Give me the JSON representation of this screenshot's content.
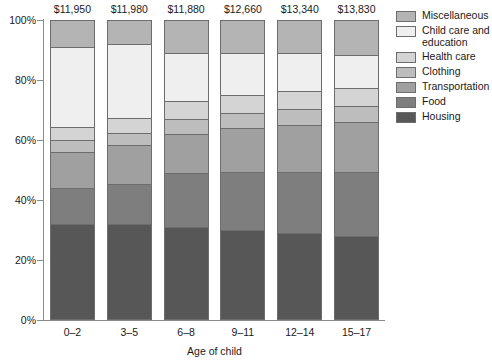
{
  "chart_data": {
    "type": "bar",
    "subtype": "stacked-percentage-column",
    "title": "",
    "xlabel": "Age of child",
    "ylabel": "",
    "ylim": [
      0,
      100
    ],
    "ytick_labels": [
      "0%",
      "20%",
      "40%",
      "60%",
      "80%",
      "100%"
    ],
    "ytick_values": [
      0,
      20,
      40,
      60,
      80,
      100
    ],
    "grid": false,
    "legend_position": "right",
    "categories": [
      "0–2",
      "3–5",
      "6–8",
      "9–11",
      "12–14",
      "15–17"
    ],
    "bar_total_labels": [
      "$11,950",
      "$11,980",
      "$11,880",
      "$12,660",
      "$13,340",
      "$13,830"
    ],
    "bar_totals": [
      11950,
      11980,
      11880,
      12660,
      13340,
      13830
    ],
    "stack_order_bottom_to_top": [
      "Housing",
      "Food",
      "Transportation",
      "Clothing",
      "Health care",
      "Child care and education",
      "Miscellaneous"
    ],
    "series": [
      {
        "name": "Housing",
        "color": "#575757",
        "values": [
          32.0,
          32.0,
          31.0,
          30.0,
          29.0,
          28.0
        ]
      },
      {
        "name": "Food",
        "color": "#7e7e7e",
        "values": [
          12.0,
          13.5,
          18.0,
          19.5,
          20.5,
          21.5
        ]
      },
      {
        "name": "Transportation",
        "color": "#a0a0a0",
        "values": [
          12.0,
          13.0,
          13.0,
          14.5,
          15.5,
          16.5
        ]
      },
      {
        "name": "Clothing",
        "color": "#bdbdbd",
        "values": [
          4.0,
          4.0,
          5.0,
          5.0,
          5.5,
          5.5
        ]
      },
      {
        "name": "Health care",
        "color": "#d4d4d4",
        "values": [
          4.5,
          5.0,
          6.0,
          6.0,
          6.0,
          6.0
        ]
      },
      {
        "name": "Child care and education",
        "color": "#efefef",
        "values": [
          26.5,
          24.5,
          16.0,
          14.0,
          12.5,
          11.0
        ]
      },
      {
        "name": "Miscellaneous",
        "color": "#b4b4b4",
        "values": [
          9.0,
          8.0,
          11.0,
          11.0,
          11.0,
          11.5
        ]
      }
    ]
  },
  "legend": {
    "items": [
      {
        "label": "Miscellaneous",
        "color": "#b4b4b4"
      },
      {
        "label": "Child care and\neducation",
        "color": "#efefef"
      },
      {
        "label": "Health care",
        "color": "#d4d4d4"
      },
      {
        "label": "Clothing",
        "color": "#bdbdbd"
      },
      {
        "label": "Transportation",
        "color": "#a0a0a0"
      },
      {
        "label": "Food",
        "color": "#7e7e7e"
      },
      {
        "label": "Housing",
        "color": "#575757"
      }
    ]
  },
  "axis": {
    "x_title": "Age of child"
  }
}
